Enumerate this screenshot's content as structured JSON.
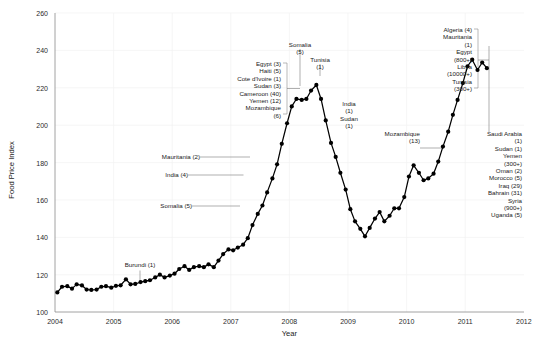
{
  "chart_data": {
    "type": "line",
    "title": "",
    "xlabel": "Year",
    "ylabel": "Food Price Index",
    "xlim": [
      2004.0,
      2012.0
    ],
    "ylim": [
      100,
      260
    ],
    "xticks": [
      "2004",
      "2005",
      "2006",
      "2007",
      "2008",
      "2009",
      "2010",
      "2011",
      "2012"
    ],
    "yticks": [
      "100",
      "120",
      "140",
      "160",
      "180",
      "200",
      "220",
      "240",
      "260"
    ],
    "grid": true,
    "legend": "none",
    "series": [
      {
        "name": "FAO Food Price Index",
        "x": [
          2004.04,
          2004.12,
          2004.21,
          2004.29,
          2004.37,
          2004.46,
          2004.54,
          2004.62,
          2004.71,
          2004.79,
          2004.87,
          2004.96,
          2005.04,
          2005.12,
          2005.21,
          2005.29,
          2005.37,
          2005.46,
          2005.54,
          2005.62,
          2005.71,
          2005.79,
          2005.87,
          2005.96,
          2006.04,
          2006.12,
          2006.21,
          2006.29,
          2006.37,
          2006.46,
          2006.54,
          2006.62,
          2006.71,
          2006.79,
          2006.87,
          2006.96,
          2007.04,
          2007.12,
          2007.21,
          2007.29,
          2007.37,
          2007.46,
          2007.54,
          2007.62,
          2007.71,
          2007.79,
          2007.87,
          2007.96,
          2008.04,
          2008.12,
          2008.21,
          2008.29,
          2008.37,
          2008.46,
          2008.54,
          2008.62,
          2008.71,
          2008.79,
          2008.87,
          2008.96,
          2009.04,
          2009.12,
          2009.21,
          2009.29,
          2009.37,
          2009.46,
          2009.54,
          2009.62,
          2009.71,
          2009.79,
          2009.87,
          2009.96,
          2010.04,
          2010.12,
          2010.21,
          2010.29,
          2010.37,
          2010.46,
          2010.54,
          2010.62,
          2010.71,
          2010.79,
          2010.87,
          2010.96,
          2011.04,
          2011.12,
          2011.21,
          2011.29,
          2011.37
        ],
        "y": [
          110.5,
          113.5,
          113.8,
          112.5,
          114.8,
          114.2,
          112.0,
          111.8,
          112.0,
          113.5,
          113.8,
          113.0,
          114.0,
          114.3,
          117.5,
          114.8,
          115.0,
          116.0,
          116.5,
          117.0,
          118.5,
          120.0,
          118.5,
          119.5,
          120.5,
          123.0,
          124.5,
          122.5,
          124.0,
          124.5,
          124.0,
          125.5,
          124.0,
          127.5,
          131.0,
          133.5,
          133.0,
          134.5,
          136.0,
          139.5,
          146.5,
          152.5,
          157.0,
          164.0,
          171.5,
          179.0,
          190.0,
          201.0,
          210.0,
          214.0,
          213.5,
          214.0,
          218.5,
          221.5,
          214.0,
          202.5,
          190.5,
          183.0,
          174.5,
          165.5,
          155.0,
          148.5,
          144.5,
          140.5,
          145.0,
          150.0,
          153.5,
          148.5,
          151.5,
          155.5,
          155.5,
          161.5,
          172.5,
          178.5,
          174.5,
          170.5,
          171.5,
          174.0,
          180.5,
          188.5,
          196.5,
          205.5,
          213.5,
          222.5,
          231.5,
          235.0,
          229.5,
          233.5,
          230.5
        ]
      }
    ],
    "annotations": [
      {
        "id": "burundi",
        "text": "Burundi (1)",
        "lines": [
          "Burundi (1)"
        ],
        "align": "center"
      },
      {
        "id": "somalia-5",
        "text": "Somalia (5)",
        "lines": [
          "Somalia (5)"
        ],
        "align": "right"
      },
      {
        "id": "india-4",
        "text": "India (4)",
        "lines": [
          "India (4)"
        ],
        "align": "right"
      },
      {
        "id": "mauritania-2",
        "text": "Mauritania (2)",
        "lines": [
          "Mauritania (2)"
        ],
        "align": "right"
      },
      {
        "id": "group-2008-left",
        "align": "right",
        "lines": [
          "Egypt (3)",
          "Haiti (5)",
          "Cote d'Ivoire (1)",
          "Sudan (3)",
          "Cameroon (40)",
          "Yemen (12)",
          "Mozambique",
          "(6)"
        ]
      },
      {
        "id": "somalia-peak",
        "align": "center",
        "lines": [
          "Somalia",
          "(5)"
        ]
      },
      {
        "id": "tunisia-2008",
        "align": "center",
        "lines": [
          "Tunisia",
          "(1)"
        ]
      },
      {
        "id": "india-sudan",
        "align": "center",
        "lines": [
          "India",
          "(1)",
          "Sudan",
          "(1)"
        ]
      },
      {
        "id": "mozambique-13",
        "align": "right",
        "lines": [
          "Mozambique",
          "(13)"
        ]
      },
      {
        "id": "group-2011-top",
        "align": "right",
        "lines": [
          "Algeria (4)",
          "Mauritania",
          "(1)",
          "Egypt",
          "(800+)",
          "Libya",
          "(10000+)",
          "Tunisia",
          "(300+)"
        ]
      },
      {
        "id": "group-2011-right",
        "align": "right",
        "lines": [
          "Saudi Arabia",
          "(1)",
          "Sudan (1)",
          "Yemen",
          "(300+)",
          "Oman (2)",
          "Morocco (5)",
          "Iraq (29)",
          "Bahrain (31)",
          "Syria",
          "(900+)",
          "Uganda (5)"
        ]
      }
    ]
  }
}
